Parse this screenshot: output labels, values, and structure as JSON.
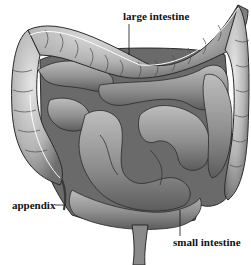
{
  "figure": {
    "style": "grayscale anatomical illustration"
  },
  "labels": {
    "large_intestine": "large intestine",
    "appendix": "appendix",
    "small_intestine": "small intestine"
  },
  "colors": {
    "background": "#ffffff",
    "text": "#111111",
    "tissue_light": "#c9c9c9",
    "tissue_mid": "#9a9a9a",
    "tissue_dark": "#5a5a5a",
    "outline": "#2a2a2a"
  }
}
